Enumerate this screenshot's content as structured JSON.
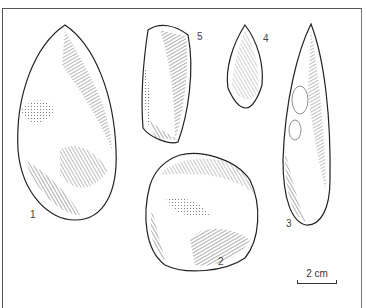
{
  "figure": {
    "artifacts": [
      {
        "id": "1",
        "label": "1",
        "shape": "handaxe"
      },
      {
        "id": "2",
        "label": "2",
        "shape": "round core"
      },
      {
        "id": "3",
        "label": "3",
        "shape": "elongated point"
      },
      {
        "id": "4",
        "label": "4",
        "shape": "leaf point"
      },
      {
        "id": "5",
        "label": "5",
        "shape": "flake"
      }
    ],
    "scale_bar": {
      "label": "2 cm"
    }
  }
}
